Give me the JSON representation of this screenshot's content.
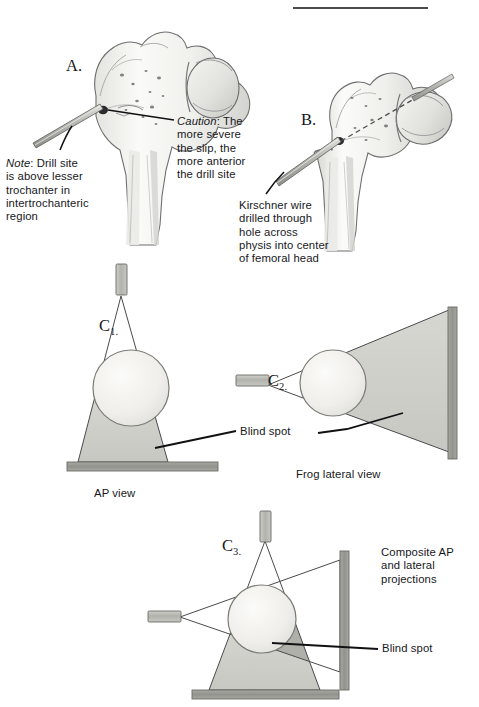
{
  "figure": {
    "type": "medical-illustration",
    "top_rule": {
      "name": "header-rule",
      "x": 293,
      "y": 7,
      "width": 135
    }
  },
  "panels": [
    {
      "id": "A",
      "letter": "A.",
      "label_x": 66,
      "label_y": 56,
      "view": "AP femur with drill at entry site"
    },
    {
      "id": "B",
      "letter": "B.",
      "label_x": 301,
      "label_y": 110,
      "view": "Frog lateral femur with Kirschner wire through physis"
    },
    {
      "id": "C1",
      "letter": "C",
      "subscript": "1.",
      "label_x": 99,
      "label_y": 297,
      "caption": "AP view",
      "caption_x": 94,
      "caption_y": 487
    },
    {
      "id": "C2",
      "letter": "C",
      "subscript": "2.",
      "label_x": 268,
      "label_y": 352,
      "caption": "Frog lateral view",
      "caption_x": 296,
      "caption_y": 468
    },
    {
      "id": "C3",
      "letter": "C",
      "subscript": "3.",
      "label_x": 222,
      "label_y": 517,
      "caption": "",
      "caption_x": 0,
      "caption_y": 0
    }
  ],
  "annotations": [
    {
      "name": "note-drill-site",
      "lead_word": "Note",
      "lead_style": "italic",
      "text": ": Drill site\nis above lesser\ntrochanter in\nintertrochanteric\nregion",
      "x": 6,
      "y": 157,
      "width": 115
    },
    {
      "name": "caution-anterior-drill-site",
      "lead_word": "Caution",
      "lead_style": "italic",
      "text": ": The\nmore severe\nthe slip, the\nmore anterior\nthe drill site",
      "x": 177,
      "y": 115,
      "width": 105
    },
    {
      "name": "kirschner-wire-note",
      "lead_word": "",
      "lead_style": "normal",
      "text": "Kirschner wire\ndrilled through\nhole across\nphysis into center\nof femoral head",
      "x": 239,
      "y": 199,
      "width": 120
    },
    {
      "name": "blind-spot-c1-c2",
      "lead_word": "",
      "lead_style": "normal",
      "text": "Blind spot",
      "x": 240,
      "y": 432,
      "width": 70
    },
    {
      "name": "composite-projections",
      "lead_word": "",
      "lead_style": "normal",
      "text": "Composite AP\nand lateral\nprojections",
      "x": 381,
      "y": 546,
      "width": 96
    },
    {
      "name": "blind-spot-c3",
      "lead_word": "",
      "lead_style": "normal",
      "text": "Blind spot",
      "x": 382,
      "y": 645,
      "width": 70
    }
  ],
  "colors": {
    "ink": "#17171b",
    "bone_outline": "#6f6f72",
    "bone_fill": "#f2f2f0",
    "bone_shadow": "#c9c9c6",
    "beam_fill": "#cfcfc9",
    "beam_fill_dark": "#b0b0aa",
    "beam_edge": "#4a4a4d",
    "plate_fill": "#9a9a95",
    "plate_edge": "#6a6a66",
    "source_fill": "#b9b9b4",
    "circle_fill": "#efeeea",
    "circle_edge": "#7b7b78",
    "wire_fill": "#c5c5c0",
    "wire_edge": "#5d5d5a",
    "leader_line": "#111114",
    "rule": "#4a4a4d"
  },
  "diagram_geometry": {
    "c1_ap": {
      "source": {
        "x": 116,
        "y": 264,
        "w": 11,
        "h": 30
      },
      "apex": {
        "x": 121,
        "y": 296
      },
      "beam_left": {
        "x": 78,
        "y": 462
      },
      "beam_right": {
        "x": 168,
        "y": 462
      },
      "circle": {
        "cx": 131,
        "cy": 388,
        "r": 38
      },
      "plate": {
        "x": 67,
        "y": 462,
        "w": 151,
        "h": 9
      }
    },
    "c2_lateral": {
      "source": {
        "x": 236,
        "y": 374,
        "w": 32,
        "h": 11
      },
      "apex": {
        "x": 268,
        "y": 385
      },
      "beam_top": {
        "x": 449,
        "y": 310
      },
      "beam_bottom": {
        "x": 449,
        "y": 452
      },
      "circle": {
        "cx": 333,
        "cy": 383,
        "r": 33
      },
      "plate": {
        "x": 449,
        "y": 308,
        "w": 9,
        "h": 150
      }
    },
    "c3_composite": {
      "ap_source": {
        "x": 260,
        "y": 510,
        "w": 11,
        "h": 30
      },
      "ap_apex": {
        "x": 265,
        "y": 541
      },
      "ap_left": {
        "x": 209,
        "y": 690
      },
      "ap_right": {
        "x": 320,
        "y": 690
      },
      "lat_source": {
        "x": 148,
        "y": 611,
        "w": 32,
        "h": 11
      },
      "lat_apex": {
        "x": 180,
        "y": 617
      },
      "lat_top": {
        "x": 340,
        "y": 560
      },
      "lat_bottom": {
        "x": 340,
        "y": 672
      },
      "circle": {
        "cx": 262,
        "cy": 619,
        "r": 34
      },
      "bottom_plate": {
        "x": 192,
        "y": 690,
        "w": 146,
        "h": 9
      },
      "side_plate": {
        "x": 340,
        "y": 551,
        "w": 9,
        "h": 138
      }
    }
  }
}
